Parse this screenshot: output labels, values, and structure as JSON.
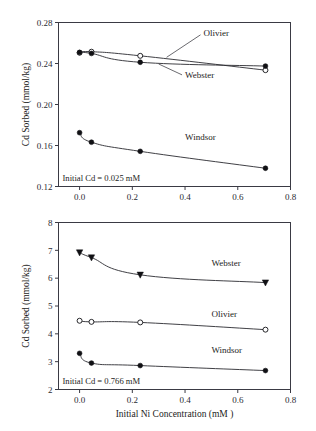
{
  "figure": {
    "title": "",
    "background": "#ffffff",
    "axis_color": "#3a3a44",
    "line_color": "#2a2a30"
  },
  "chart_data": [
    {
      "type": "line",
      "panel": "top",
      "title": "",
      "xlabel": "",
      "ylabel": "Cd Sorbed (mmol/kg)",
      "xlim": [
        -0.08,
        0.8
      ],
      "ylim": [
        0.12,
        0.28
      ],
      "xticks": [
        0.0,
        0.2,
        0.4,
        0.6,
        0.8
      ],
      "xticklabels": [
        "0.0",
        "0.2",
        "0.4",
        "0.6",
        "0.8"
      ],
      "yticks": [
        0.12,
        0.16,
        0.2,
        0.24,
        0.28
      ],
      "yticklabels": [
        "0.12",
        "0.16",
        "0.20",
        "0.24",
        "0.28"
      ],
      "grid": false,
      "legend_position": "inline-annotations",
      "annotation": "Initial Cd = 0.025 mM",
      "x": [
        0.0,
        0.045,
        0.23,
        0.705
      ],
      "series": [
        {
          "name": "Olivier",
          "marker": "open-circle",
          "values": [
            0.2505,
            0.2515,
            0.2475,
            0.2335
          ],
          "label_x": 0.47,
          "label_y": 0.2665
        },
        {
          "name": "Webster",
          "marker": "filled-circle",
          "values": [
            0.2508,
            0.2498,
            0.2412,
            0.2375
          ],
          "label_x": 0.4,
          "label_y": 0.2255
        },
        {
          "name": "Windsor",
          "marker": "filled-circle",
          "values": [
            0.1725,
            0.1632,
            0.1543,
            0.1378
          ],
          "label_x": 0.4,
          "label_y": 0.1655
        }
      ]
    },
    {
      "type": "line",
      "panel": "bottom",
      "title": "",
      "xlabel": "Initial Ni Concentration (mM )",
      "ylabel": "Cd Sorbed (mmol/kg)",
      "xlim": [
        -0.08,
        0.8
      ],
      "ylim": [
        2,
        8
      ],
      "xticks": [
        0.0,
        0.2,
        0.4,
        0.6,
        0.8
      ],
      "xticklabels": [
        "0.0",
        "0.2",
        "0.4",
        "0.6",
        "0.8"
      ],
      "yticks": [
        2,
        3,
        4,
        5,
        6,
        7,
        8
      ],
      "yticklabels": [
        "2",
        "3",
        "4",
        "5",
        "6",
        "7",
        "8"
      ],
      "grid": false,
      "legend_position": "inline-annotations",
      "annotation": "Initial Cd = 0.766 mM",
      "x": [
        0.0,
        0.045,
        0.23,
        0.705
      ],
      "series": [
        {
          "name": "Webster",
          "marker": "filled-triangle-down",
          "values": [
            6.92,
            6.74,
            6.12,
            5.84
          ],
          "label_x": 0.5,
          "label_y": 6.45
        },
        {
          "name": "Olivier",
          "marker": "open-circle",
          "values": [
            4.47,
            4.43,
            4.41,
            4.15
          ],
          "label_x": 0.5,
          "label_y": 4.62
        },
        {
          "name": "Windsor",
          "marker": "filled-circle",
          "values": [
            3.3,
            2.95,
            2.86,
            2.68
          ],
          "label_x": 0.5,
          "label_y": 3.32
        }
      ]
    }
  ]
}
